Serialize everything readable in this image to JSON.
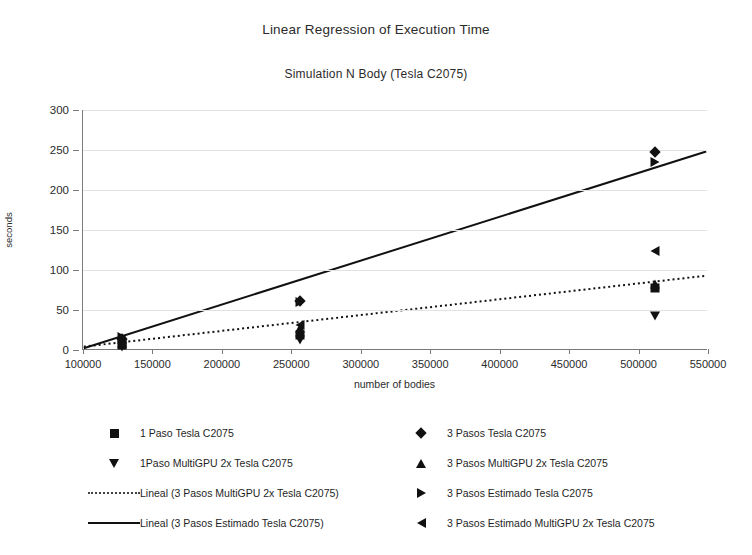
{
  "chart_data": {
    "type": "scatter",
    "title": "Linear Regression of Execution Time",
    "subtitle": "Simulation N Body (Tesla C2075)",
    "xlabel": "number of bodies",
    "ylabel": "seconds",
    "xlim": [
      100000,
      550000
    ],
    "ylim": [
      0,
      300
    ],
    "xticks": [
      "100000",
      "150000",
      "200000",
      "250000",
      "300000",
      "350000",
      "400000",
      "450000",
      "500000",
      "550000"
    ],
    "yticks": [
      "0",
      "50",
      "100",
      "150",
      "200",
      "250",
      "300"
    ],
    "grid": true,
    "legend_position": "bottom",
    "series": [
      {
        "name": "1 Paso Tesla C2075",
        "marker": "square",
        "points": [
          {
            "x": 128000,
            "y": 6
          },
          {
            "x": 256000,
            "y": 19
          },
          {
            "x": 512000,
            "y": 78
          }
        ]
      },
      {
        "name": "3 Pasos Tesla C2075",
        "marker": "diamond",
        "points": [
          {
            "x": 128000,
            "y": 14
          },
          {
            "x": 256000,
            "y": 61
          },
          {
            "x": 512000,
            "y": 248
          }
        ]
      },
      {
        "name": "1Paso MultiGPU 2x Tesla C2075",
        "marker": "triangle-down",
        "points": [
          {
            "x": 128000,
            "y": 4
          },
          {
            "x": 256000,
            "y": 12
          },
          {
            "x": 512000,
            "y": 42
          }
        ]
      },
      {
        "name": "3 Pasos MultiGPU 2x Tesla C2075",
        "marker": "triangle-up",
        "points": [
          {
            "x": 128000,
            "y": 9
          },
          {
            "x": 256000,
            "y": 27
          },
          {
            "x": 512000,
            "y": 82
          }
        ]
      },
      {
        "name": "3 Pasos Estimado Tesla C2075",
        "marker": "triangle-right",
        "points": [
          {
            "x": 128000,
            "y": 16
          },
          {
            "x": 256000,
            "y": 60
          },
          {
            "x": 512000,
            "y": 235
          }
        ]
      },
      {
        "name": "3 Pasos Estimado MultiGPU 2x Tesla C2075",
        "marker": "triangle-left",
        "points": [
          {
            "x": 128000,
            "y": 8
          },
          {
            "x": 256000,
            "y": 31
          },
          {
            "x": 512000,
            "y": 124
          }
        ]
      }
    ],
    "trendlines": [
      {
        "name": "Lineal (3 Pasos MultiGPU 2x Tesla C2075)",
        "style": "dotted",
        "x0": 100000,
        "y0": 3,
        "x1": 550000,
        "y1": 92
      },
      {
        "name": "Lineal (3 Pasos Estimado Tesla C2075)",
        "style": "solid",
        "x0": 100000,
        "y0": 1,
        "x1": 550000,
        "y1": 248
      }
    ]
  },
  "legend": {
    "left_column": [
      {
        "key": "square",
        "label": "1 Paso Tesla C2075"
      },
      {
        "key": "triangle-down",
        "label": "1Paso MultiGPU 2x Tesla C2075"
      },
      {
        "key": "line-dotted",
        "label": "Lineal (3 Pasos MultiGPU 2x Tesla C2075)"
      },
      {
        "key": "line-solid",
        "label": "Lineal (3 Pasos Estimado Tesla C2075)"
      }
    ],
    "right_column": [
      {
        "key": "diamond",
        "label": "3 Pasos Tesla C2075"
      },
      {
        "key": "triangle-up",
        "label": "3 Pasos MultiGPU 2x Tesla C2075"
      },
      {
        "key": "triangle-right",
        "label": "3 Pasos Estimado Tesla C2075"
      },
      {
        "key": "triangle-left",
        "label": "3 Pasos Estimado MultiGPU 2x Tesla C2075"
      }
    ]
  },
  "colors": {
    "ink": "#111111",
    "grid": "#e2e2e2",
    "axis": "#7a7a7a",
    "background": "#ffffff"
  }
}
